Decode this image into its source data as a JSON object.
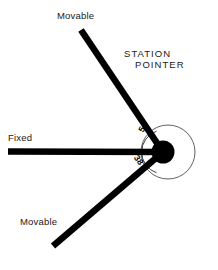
{
  "diagram": {
    "title_text": {
      "line1": "STATION",
      "line2": "POINTER"
    },
    "labels": {
      "movable_top": "Movable",
      "fixed": "Fixed",
      "movable_bottom": "Movable"
    },
    "angles": {
      "upper": "54",
      "lower": "38"
    },
    "colors": {
      "ink": "#000000",
      "text": "#1a1a1a",
      "background": "#ffffff",
      "scale_line": "#2b2b2b"
    },
    "geometry": {
      "hub": {
        "cx": 163,
        "cy": 152,
        "r": 11
      },
      "outer_circle": {
        "cx": 168,
        "cy": 152,
        "r": 27
      },
      "scale_arc_radius": 22,
      "arm_thickness": 6.5,
      "arms": [
        {
          "name": "movable-upper",
          "x1": 81,
          "y1": 30,
          "x2": 163,
          "y2": 152
        },
        {
          "name": "fixed-horizontal",
          "x1": 8,
          "y1": 151,
          "x2": 163,
          "y2": 152
        },
        {
          "name": "movable-lower",
          "x1": 53,
          "y1": 246,
          "x2": 163,
          "y2": 152
        }
      ]
    }
  }
}
